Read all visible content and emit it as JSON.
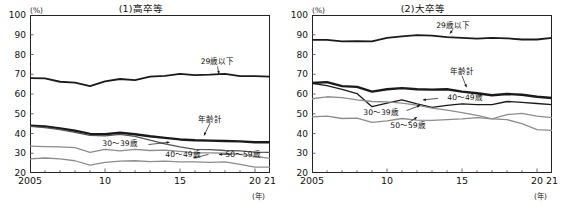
{
  "figure": {
    "y_unit": "(%)",
    "x_unit": "(年)"
  },
  "chart_data": [
    {
      "type": "line",
      "title": "(1)高卒等",
      "xlabel": "(年)",
      "ylabel": "(%)",
      "ylim": [
        20,
        100
      ],
      "yticks": [
        20,
        30,
        40,
        50,
        60,
        70,
        80,
        90,
        100
      ],
      "xlim": [
        2005,
        2021
      ],
      "xticks": [
        2005,
        2010,
        2015,
        2020,
        2021
      ],
      "xticklabels": [
        "2005",
        "10",
        "15",
        "20",
        "21"
      ],
      "grid": false,
      "legend": "inline-annotations",
      "x": [
        2005,
        2006,
        2007,
        2008,
        2009,
        2010,
        2011,
        2012,
        2013,
        2014,
        2015,
        2016,
        2017,
        2018,
        2019,
        2020,
        2021
      ],
      "series": [
        {
          "name": "29歳以下",
          "color": "#1a1a1a",
          "width": 1.8,
          "values": [
            68.0,
            67.9,
            66.2,
            65.8,
            64.0,
            66.4,
            67.6,
            67.0,
            68.8,
            69.2,
            70.2,
            69.6,
            69.8,
            70.2,
            69.0,
            69.0,
            68.8
          ]
        },
        {
          "name": "年齢計",
          "color": "#1a1a1a",
          "width": 2.4,
          "values": [
            44.0,
            43.6,
            42.6,
            41.4,
            39.8,
            39.6,
            40.4,
            39.6,
            38.6,
            37.8,
            37.0,
            36.6,
            36.4,
            36.2,
            36.0,
            35.6,
            35.6
          ]
        },
        {
          "name": "30～39歳",
          "color": "#555555",
          "width": 1.3,
          "values": [
            43.6,
            43.0,
            42.0,
            40.6,
            39.0,
            38.8,
            39.6,
            38.6,
            36.6,
            34.8,
            33.2,
            32.0,
            31.8,
            31.4,
            31.2,
            30.6,
            30.4
          ]
        },
        {
          "name": "40～49歳",
          "color": "#8c8c8c",
          "width": 1.3,
          "values": [
            33.6,
            33.4,
            33.2,
            32.8,
            30.4,
            32.0,
            31.2,
            32.0,
            31.4,
            31.6,
            31.0,
            30.2,
            30.2,
            30.0,
            29.4,
            28.4,
            27.4
          ]
        },
        {
          "name": "50～59歳",
          "color": "#8c8c8c",
          "width": 1.3,
          "values": [
            27.2,
            27.6,
            27.2,
            26.2,
            24.0,
            25.4,
            26.0,
            26.2,
            25.8,
            26.0,
            25.6,
            25.6,
            25.4,
            25.6,
            24.4,
            23.0,
            23.0
          ]
        }
      ],
      "annotations": [
        {
          "text": "29歳以下",
          "x": 12.5,
          "y": 76.0
        },
        {
          "text": "年齢計",
          "x": 12.0,
          "y": 47.0
        },
        {
          "text": "30～39歳",
          "x": 6.0,
          "y": 34.6
        },
        {
          "text": "40～49歳",
          "x": 10.2,
          "y": 29.2
        },
        {
          "text": "50～59歳",
          "x": 14.2,
          "y": 29.2
        }
      ]
    },
    {
      "type": "line",
      "title": "(2)大卒等",
      "xlabel": "(年)",
      "ylabel": "(%)",
      "ylim": [
        20,
        100
      ],
      "yticks": [
        20,
        30,
        40,
        50,
        60,
        70,
        80,
        90,
        100
      ],
      "xlim": [
        2005,
        2021
      ],
      "xticks": [
        2005,
        2010,
        2015,
        2020,
        2021
      ],
      "xticklabels": [
        "2005",
        "10",
        "15",
        "20",
        "21"
      ],
      "grid": false,
      "legend": "inline-annotations",
      "x": [
        2005,
        2006,
        2007,
        2008,
        2009,
        2010,
        2011,
        2012,
        2013,
        2014,
        2015,
        2016,
        2017,
        2018,
        2019,
        2020,
        2021
      ],
      "series": [
        {
          "name": "29歳以下",
          "color": "#1a1a1a",
          "width": 1.8,
          "values": [
            87.4,
            87.4,
            86.6,
            86.8,
            86.6,
            88.4,
            89.2,
            89.8,
            89.6,
            88.8,
            88.4,
            88.0,
            88.4,
            88.2,
            87.6,
            87.6,
            88.4
          ]
        },
        {
          "name": "年齢計",
          "color": "#1a1a1a",
          "width": 2.4,
          "values": [
            65.6,
            66.0,
            64.0,
            63.6,
            61.2,
            62.4,
            63.0,
            62.4,
            62.2,
            62.4,
            61.2,
            60.4,
            59.4,
            60.0,
            59.6,
            58.6,
            58.0
          ]
        },
        {
          "name": "30～39歳",
          "color": "#1a1a1a",
          "width": 1.3,
          "values": [
            65.4,
            64.2,
            62.4,
            60.2,
            53.6,
            55.4,
            57.0,
            55.0,
            53.2,
            54.2,
            55.0,
            54.6,
            54.6,
            56.2,
            55.8,
            55.2,
            54.6
          ]
        },
        {
          "name": "40～49歳",
          "color": "#8c8c8c",
          "width": 1.3,
          "values": [
            57.6,
            58.6,
            58.2,
            57.0,
            56.2,
            56.0,
            55.4,
            54.4,
            52.8,
            51.8,
            50.6,
            49.2,
            47.4,
            49.6,
            50.2,
            48.8,
            48.0
          ]
        },
        {
          "name": "50～59歳",
          "color": "#8c8c8c",
          "width": 1.3,
          "values": [
            48.4,
            48.8,
            47.6,
            47.8,
            45.6,
            46.4,
            47.6,
            46.8,
            46.6,
            47.0,
            47.4,
            48.0,
            47.4,
            47.0,
            45.0,
            42.0,
            41.6
          ]
        }
      ],
      "annotations": [
        {
          "text": "29歳以下",
          "x": 9.4,
          "y": 94.5
        },
        {
          "text": "年齢計",
          "x": 10.0,
          "y": 71.0
        },
        {
          "text": "40～49歳",
          "x": 10.2,
          "y": 57.8
        },
        {
          "text": "30～39歳",
          "x": 4.6,
          "y": 50.4
        },
        {
          "text": "50～59歳",
          "x": 6.4,
          "y": 43.6
        }
      ]
    }
  ]
}
